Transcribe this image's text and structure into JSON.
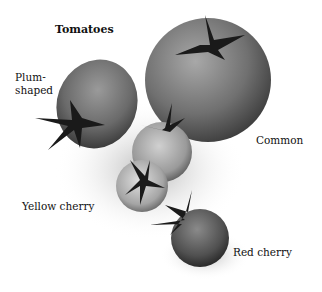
{
  "figure": {
    "title": "Tomatoes",
    "labels": {
      "plum": [
        "Plum-",
        "shaped"
      ],
      "common": "Common",
      "yellow_cherry": "Yellow cherry",
      "red_cherry": "Red cherry"
    }
  }
}
